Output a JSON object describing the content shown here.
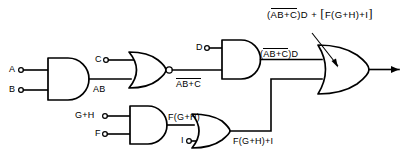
{
  "diagram": {
    "stroke_color": "#000000",
    "background_color": "#ffffff",
    "inputs": [
      {
        "id": "A",
        "label": "A",
        "feeds": "and-gate-1"
      },
      {
        "id": "B",
        "label": "B",
        "feeds": "and-gate-1"
      },
      {
        "id": "C",
        "label": "C",
        "feeds": "nor-gate-1"
      },
      {
        "id": "D",
        "label": "D",
        "feeds": "and-gate-2"
      },
      {
        "id": "GH",
        "label": "G+H",
        "feeds": "and-gate-3"
      },
      {
        "id": "F",
        "label": "F",
        "feeds": "and-gate-3"
      },
      {
        "id": "I",
        "label": "I",
        "feeds": "or-gate-2"
      }
    ],
    "gates": [
      {
        "id": "and-gate-1",
        "type": "AND",
        "inputs": [
          "A",
          "B"
        ],
        "output_label": "AB"
      },
      {
        "id": "nor-gate-1",
        "type": "NOR",
        "inputs": [
          "C",
          "AB"
        ],
        "output_label_main": "AB+C",
        "output_overbar": true
      },
      {
        "id": "and-gate-2",
        "type": "AND",
        "inputs": [
          "D",
          "AB+C(bar)"
        ],
        "output_label_bar": "AB+C",
        "output_label_tail": ")D",
        "output_label_head": "("
      },
      {
        "id": "and-gate-3",
        "type": "AND",
        "inputs": [
          "G+H",
          "F"
        ],
        "output_label": "F(G+H)"
      },
      {
        "id": "or-gate-2",
        "type": "OR",
        "inputs": [
          "F(G+H)",
          "I"
        ],
        "output_label": "F(G+H)+I"
      },
      {
        "id": "or-gate-3",
        "type": "OR",
        "inputs": [
          "(AB+C)D",
          "F(G+H)+I"
        ],
        "output_label": "final"
      }
    ],
    "wire_labels": {
      "ab": "AB",
      "nor_out_bar": "AB+C",
      "and2_out_open": "(",
      "and2_out_bar": "AB+C",
      "and2_out_close": ")D",
      "and3_out": "F(G+H)",
      "or2_out": "F(G+H)+I"
    },
    "final_output_label": {
      "open_paren": "(",
      "barred": "AB+C",
      "after_bar": ")D",
      "plus": "+",
      "bracket_open": "[",
      "bracket_body": "F(G+H)+I",
      "bracket_close": "]"
    }
  }
}
